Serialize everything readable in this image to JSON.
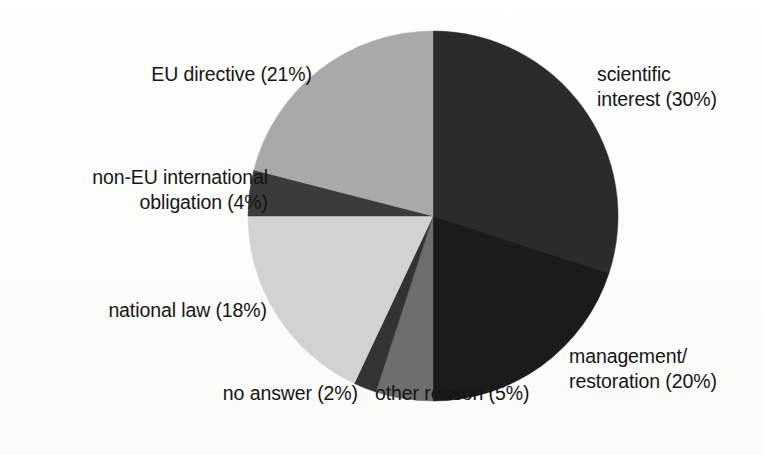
{
  "figure": {
    "background_color": "#fdfdfc",
    "text_color": "#151515"
  },
  "chart_data": {
    "type": "pie",
    "title": "",
    "subtitle": "",
    "xlabel": "",
    "ylabel": "",
    "legend_position": "none",
    "grid": false,
    "units": "percent",
    "total": 100,
    "start_angle_deg": 0,
    "direction": "clockwise",
    "center": {
      "x": 433,
      "y": 216
    },
    "radius": 185,
    "categories": [
      "scientific interest",
      "management/restoration",
      "other reason",
      "no answer",
      "national law",
      "non-EU international obligation",
      "EU directive"
    ],
    "values": [
      30,
      20,
      5,
      2,
      18,
      4,
      21
    ],
    "slices": [
      {
        "name": "scientific-interest",
        "label": "scientific\ninterest (30%)",
        "category": "scientific interest",
        "value": 30,
        "percent_text": "30%",
        "color": "#2b2b2b",
        "start_deg": 0,
        "end_deg": 108
      },
      {
        "name": "management-restoration",
        "label": "management/\nrestoration (20%)",
        "category": "management/restoration",
        "value": 20,
        "percent_text": "20%",
        "color": "#1b1b1b",
        "start_deg": 108,
        "end_deg": 180
      },
      {
        "name": "other-reason",
        "label": "other reason (5%)",
        "category": "other reason",
        "value": 5,
        "percent_text": "5%",
        "color": "#6e6e6e",
        "start_deg": 180,
        "end_deg": 198
      },
      {
        "name": "no-answer",
        "label": "no answer (2%)",
        "category": "no answer",
        "value": 2,
        "percent_text": "2%",
        "color": "#333333",
        "start_deg": 198,
        "end_deg": 205.2
      },
      {
        "name": "national-law",
        "label": "national law (18%)",
        "category": "national law",
        "value": 18,
        "percent_text": "18%",
        "color": "#d2d2d2",
        "start_deg": 205.2,
        "end_deg": 270
      },
      {
        "name": "non-eu-international-obligation",
        "label": "non-EU international\nobligation (4%)",
        "category": "non-EU international obligation",
        "value": 4,
        "percent_text": "4%",
        "color": "#3b3b3b",
        "start_deg": 270,
        "end_deg": 284.4
      },
      {
        "name": "eu-directive",
        "label": "EU directive (21%)",
        "category": "EU directive",
        "value": 21,
        "percent_text": "21%",
        "color": "#a9a9a9",
        "start_deg": 284.4,
        "end_deg": 360
      }
    ]
  }
}
